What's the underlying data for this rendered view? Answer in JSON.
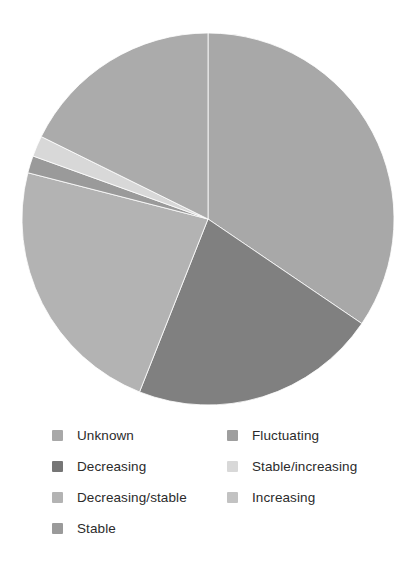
{
  "figure": {
    "title_remnant": "",
    "background_color": "#ffffff"
  },
  "chart_data": {
    "type": "pie",
    "title": "",
    "xlabel": "",
    "ylabel": "",
    "grid": false,
    "legend_position": "bottom",
    "legend_columns": 2,
    "start_angle_deg": 0,
    "direction": "clockwise",
    "center": {
      "x": 208,
      "y": 219
    },
    "radius": 186,
    "categories": [
      "Unknown",
      "Decreasing",
      "Decreasing/stable",
      "Stable",
      "Stable/increasing",
      "Fluctuating",
      "Increasing"
    ],
    "values": [
      34.5,
      21.5,
      23.0,
      1.5,
      1.8,
      17.7,
      0.0
    ],
    "units": "percent",
    "slices": [
      {
        "label": "Unknown",
        "value": 34.5,
        "start_deg": 0.0,
        "end_deg": 124.2,
        "color": "#a8a8a8"
      },
      {
        "label": "Decreasing",
        "value": 21.5,
        "start_deg": 124.2,
        "end_deg": 201.6,
        "color": "#808080"
      },
      {
        "label": "Decreasing/stable",
        "value": 23.0,
        "start_deg": 201.6,
        "end_deg": 284.4,
        "color": "#b3b3b3"
      },
      {
        "label": "Stable",
        "value": 1.5,
        "start_deg": 284.4,
        "end_deg": 289.8,
        "color": "#9a9a9a"
      },
      {
        "label": "Stable/increasing",
        "value": 1.8,
        "start_deg": 289.8,
        "end_deg": 296.3,
        "color": "#d8d8d8"
      },
      {
        "label": "Fluctuating",
        "value": 17.7,
        "start_deg": 296.3,
        "end_deg": 360.0,
        "color": "#ababab"
      },
      {
        "label": "Increasing",
        "value": 0.0,
        "start_deg": 360.0,
        "end_deg": 360.0,
        "color": "#c2c2c2"
      }
    ]
  },
  "legend": {
    "columns": [
      {
        "items": [
          {
            "label": "Unknown",
            "color": "#a8a8a8"
          },
          {
            "label": "Decreasing",
            "color": "#767676"
          },
          {
            "label": "Decreasing/stable",
            "color": "#b3b3b3"
          },
          {
            "label": "Stable",
            "color": "#9a9a9a"
          }
        ]
      },
      {
        "items": [
          {
            "label": "Fluctuating",
            "color": "#9e9e9e"
          },
          {
            "label": "Stable/increasing",
            "color": "#d8d8d8"
          },
          {
            "label": "Increasing",
            "color": "#c2c2c2"
          }
        ]
      }
    ]
  }
}
